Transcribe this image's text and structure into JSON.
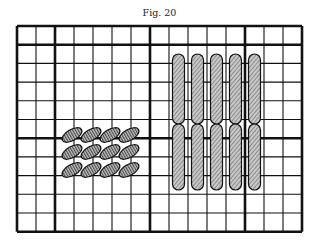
{
  "figure": {
    "caption": "Fig. 20",
    "grid": {
      "left": 17,
      "top": 26,
      "cell_w": 19,
      "cell_h": 18.7,
      "cols": 15,
      "rows": 11,
      "thick_cols": [
        0,
        2,
        7,
        12,
        15
      ],
      "thick_rows": [
        0,
        1,
        6,
        11
      ],
      "line_color": "#111111"
    },
    "left_group": {
      "description": "4 x 3 array of tilted ellipses with vertical hatching",
      "cols": 4,
      "rows": 3,
      "centers_x": [
        72,
        91,
        110,
        129
      ],
      "centers_y": [
        135,
        152,
        170
      ],
      "rx": 11,
      "ry": 5.5,
      "rotation": -30,
      "hatch": "vertical"
    },
    "right_group": {
      "description": "5 columns x 2 rows of elongated vertical ovals with diagonal hatching",
      "centers_x": [
        178.5,
        197.5,
        216.5,
        235.5,
        254.5
      ],
      "upper": {
        "top": 54,
        "bottom": 124
      },
      "lower": {
        "top": 124,
        "bottom": 190
      },
      "width": 12,
      "hatch": "diagonal"
    }
  }
}
